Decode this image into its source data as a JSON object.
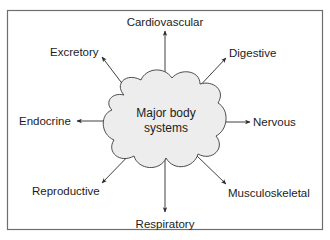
{
  "diagram": {
    "type": "radial-concept-map",
    "center": {
      "line1": "Major body",
      "line2": "systems",
      "shape": "cloud-shape"
    },
    "nodes": [
      {
        "label": "Cardiovascular",
        "direction": "up"
      },
      {
        "label": "Digestive",
        "direction": "up-right"
      },
      {
        "label": "Nervous",
        "direction": "right"
      },
      {
        "label": "Musculoskeletal",
        "direction": "down-right"
      },
      {
        "label": "Respiratory",
        "direction": "down"
      },
      {
        "label": "Reproductive",
        "direction": "down-left"
      },
      {
        "label": "Endocrine",
        "direction": "left"
      },
      {
        "label": "Excretory",
        "direction": "up-left"
      }
    ],
    "colors": {
      "cloud_fill": "#ededed",
      "cloud_stroke": "#3a3a3a",
      "frame_stroke": "#6e6e6e",
      "text": "#1c1c1c",
      "arrow": "#2a2a2a"
    }
  }
}
